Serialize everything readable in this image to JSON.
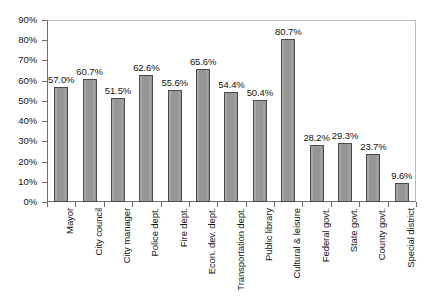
{
  "chart_data": {
    "type": "bar",
    "title": "",
    "subtitle": "",
    "xlabel": "",
    "ylabel": "",
    "ylim": [
      0,
      90
    ],
    "grid": false,
    "legend": "none",
    "orientation": "vertical",
    "bar_color": "#969696",
    "bar_border_color": "#4a4a4a",
    "axis_color": "#6c6c6c",
    "frame_color": "#b9b9b9",
    "value_suffix": "%",
    "categories": [
      "Mayor",
      "City council",
      "City manager",
      "Police dept.",
      "Fire dept.",
      "Econ. dev. dept.",
      "Transportation dept.",
      "Public library",
      "Cultural & leisure",
      "Federal govt.",
      "State govt.",
      "County govt.",
      "Special district"
    ],
    "values": [
      57.0,
      60.7,
      51.5,
      62.6,
      55.6,
      65.6,
      54.4,
      50.4,
      80.7,
      28.2,
      29.3,
      23.7,
      9.6
    ],
    "value_labels": [
      "57.0%",
      "60.7%",
      "51.5%",
      "62.6%",
      "55.6%",
      "65.6%",
      "54.4%",
      "50.4%",
      "80.7%",
      "28.2%",
      "29.3%",
      "23.7%",
      "9.6%"
    ],
    "ytick_labels": [
      "0%",
      "10%",
      "20%",
      "30%",
      "40%",
      "50%",
      "60%",
      "70%",
      "80%",
      "90%"
    ],
    "ytick_values": [
      0,
      10,
      20,
      30,
      40,
      50,
      60,
      70,
      80,
      90
    ]
  }
}
